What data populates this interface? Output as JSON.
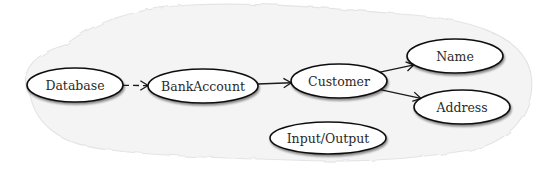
{
  "diagram": {
    "type": "dependency-graph",
    "background": {
      "color": "#ffffff",
      "blob_color": "#f3f3f3",
      "blob_stroke": "#e6e6e6"
    },
    "nodes": [
      {
        "id": "database",
        "label": "Database",
        "cx": 75,
        "cy": 85,
        "rx": 48,
        "ry": 17
      },
      {
        "id": "bankaccount",
        "label": "BankAccount",
        "cx": 203,
        "cy": 86,
        "rx": 55,
        "ry": 17
      },
      {
        "id": "customer",
        "label": "Customer",
        "cx": 339,
        "cy": 81,
        "rx": 48,
        "ry": 17
      },
      {
        "id": "name",
        "label": "Name",
        "cx": 455,
        "cy": 56,
        "rx": 48,
        "ry": 17
      },
      {
        "id": "address",
        "label": "Address",
        "cx": 462,
        "cy": 107,
        "rx": 48,
        "ry": 17
      },
      {
        "id": "inputoutput",
        "label": "Input/Output",
        "cx": 328,
        "cy": 138,
        "rx": 58,
        "ry": 16
      }
    ],
    "edges": [
      {
        "from": "database",
        "to": "bankaccount",
        "style": "dashed"
      },
      {
        "from": "bankaccount",
        "to": "customer",
        "style": "solid"
      },
      {
        "from": "customer",
        "to": "name",
        "style": "solid"
      },
      {
        "from": "customer",
        "to": "address",
        "style": "solid"
      }
    ]
  }
}
